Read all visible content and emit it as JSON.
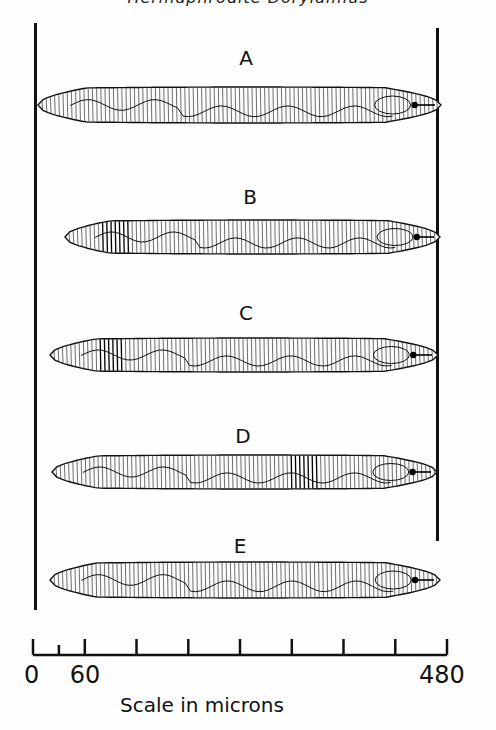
{
  "header": {
    "text": "Hermaphrodite Dorylaimus"
  },
  "specimens": [
    {
      "label": "A",
      "label_x": 246,
      "label_y": 50,
      "x1": 38,
      "x2": 441,
      "cy": 105,
      "h": 36,
      "dark_band": null
    },
    {
      "label": "B",
      "label_x": 250,
      "label_y": 189,
      "x1": 65,
      "x2": 440,
      "cy": 237,
      "h": 34,
      "dark_band": [
        100,
        132
      ]
    },
    {
      "label": "C",
      "label_x": 246,
      "label_y": 305,
      "x1": 50,
      "x2": 438,
      "cy": 355,
      "h": 34,
      "dark_band": [
        100,
        122
      ]
    },
    {
      "label": "D",
      "label_x": 243,
      "label_y": 428,
      "x1": 52,
      "x2": 437,
      "cy": 472,
      "h": 34,
      "dark_band": [
        290,
        318
      ]
    },
    {
      "label": "E",
      "label_x": 240,
      "label_y": 538,
      "x1": 50,
      "x2": 440,
      "cy": 580,
      "h": 36,
      "dark_band": null
    }
  ],
  "frame": {
    "left": {
      "x": 34,
      "y1": 23,
      "y2": 610
    },
    "right": {
      "x": 436,
      "y1": 28,
      "y2": 541
    }
  },
  "scale_bar": {
    "y": 655,
    "x0": 33,
    "x480": 447,
    "ticks_um": [
      0,
      30,
      60,
      120,
      180,
      240,
      300,
      360,
      420,
      480
    ],
    "labels": [
      {
        "text": "0",
        "um": 0
      },
      {
        "text": "60",
        "um": 60
      },
      {
        "text": "480",
        "um": 480
      }
    ],
    "caption": "Scale in microns",
    "unit": "microns",
    "max": 480
  }
}
